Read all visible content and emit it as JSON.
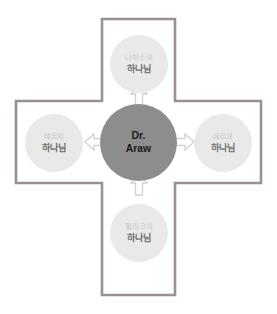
{
  "diagram": {
    "shape": "cross",
    "outline_color": "#9b9090",
    "background_color": "#ffffff",
    "center": {
      "name": "center-node",
      "label_line1": "Dr.",
      "label_line2": "Araw",
      "fill_color": "#8d8d8d",
      "text_color": "#1c1c1c"
    },
    "nodes": [
      {
        "position": "top",
        "label_sub": "나하스의",
        "label_main": "하나님",
        "fill_color": "#e9e9e9"
      },
      {
        "position": "right",
        "label_sub": "에트의",
        "label_main": "하나님",
        "fill_color": "#e9e9e9"
      },
      {
        "position": "bottom",
        "label_sub": "할라크의",
        "label_main": "하나님",
        "fill_color": "#e9e9e9"
      },
      {
        "position": "left",
        "label_sub": "에트의",
        "label_main": "하나님",
        "fill_color": "#e9e9e9"
      }
    ],
    "arrows": [
      {
        "name": "arrow-up-icon",
        "direction": "up",
        "from": "center",
        "to": "top",
        "style": "hollow-outline",
        "color": "#d0d0d0"
      },
      {
        "name": "arrow-right-icon",
        "direction": "right",
        "from": "center",
        "to": "right",
        "style": "hollow-outline",
        "color": "#d0d0d0"
      },
      {
        "name": "arrow-up-from-bottom-icon",
        "direction": "up",
        "from": "bottom",
        "to": "center",
        "style": "hollow-outline",
        "color": "#d0d0d0"
      },
      {
        "name": "arrow-left-icon",
        "direction": "left",
        "from": "center",
        "to": "left",
        "style": "hollow-outline",
        "color": "#d0d0d0"
      }
    ]
  }
}
